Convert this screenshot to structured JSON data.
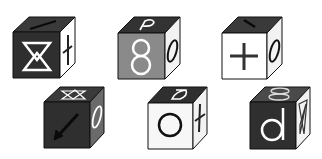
{
  "puzzle": {
    "description": "Six cubes with symbols on visible faces (front, top, right)",
    "cubes": [
      {
        "id": 1,
        "front": {
          "symbol": "hourglass-double",
          "bg": "#2f2f2f",
          "fg": "#ffffff"
        },
        "top": {
          "symbol": "line-arrow",
          "bg": "#3a3a3a",
          "fg": "#111111"
        },
        "right": {
          "symbol": "dagger",
          "bg": "#ffffff",
          "fg": "#222222"
        }
      },
      {
        "id": 2,
        "front": {
          "symbol": "8",
          "bg": "#8a8a8a",
          "fg": "#ffffff"
        },
        "top": {
          "symbol": "P",
          "bg": "#333333",
          "fg": "#ffffff"
        },
        "right": {
          "symbol": "0",
          "bg": "#f2f2f2",
          "fg": "#111111"
        }
      },
      {
        "id": 3,
        "front": {
          "symbol": "+",
          "bg": "#ffffff",
          "fg": "#333333"
        },
        "top": {
          "symbol": "backslash-line",
          "bg": "#3a3a3a",
          "fg": "#111111"
        },
        "right": {
          "symbol": "0",
          "bg": "#f2f2f2",
          "fg": "#111111"
        }
      },
      {
        "id": 4,
        "front": {
          "symbol": "arrow-down-left",
          "bg": "#2f2f2f",
          "fg": "#0a0a0a"
        },
        "top": {
          "symbol": "star-outline",
          "bg": "#3a3a3a",
          "fg": "#ffffff"
        },
        "right": {
          "symbol": "0",
          "bg": "#6a6a6a",
          "fg": "#ffffff"
        }
      },
      {
        "id": 5,
        "front": {
          "symbol": "O",
          "bg": "#f7f7f7",
          "fg": "#111111"
        },
        "top": {
          "symbol": "D-rotated",
          "bg": "#2f2f2f",
          "fg": "#ffffff"
        },
        "right": {
          "symbol": "dagger",
          "bg": "#f2f2f2",
          "fg": "#222222"
        }
      },
      {
        "id": 6,
        "front": {
          "symbol": "d",
          "bg": "#2f2f2f",
          "fg": "#ffffff"
        },
        "top": {
          "symbol": "8-rotated",
          "bg": "#4a4a4a",
          "fg": "#dddddd"
        },
        "right": {
          "symbol": "star-outline",
          "bg": "#f2f2f2",
          "fg": "#333333"
        }
      }
    ]
  }
}
